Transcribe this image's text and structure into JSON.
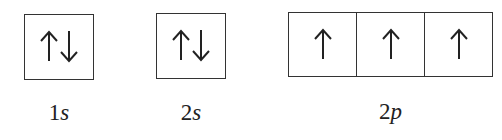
{
  "orbitals": [
    {
      "label_num": "1",
      "label_sub": "s",
      "boxes": [
        [
          "up",
          "down"
        ]
      ]
    },
    {
      "label_num": "2",
      "label_sub": "s",
      "boxes": [
        [
          "up",
          "down"
        ]
      ]
    },
    {
      "label_num": "2",
      "label_sub": "p",
      "boxes": [
        [
          "up"
        ],
        [
          "up"
        ],
        [
          "up"
        ]
      ]
    }
  ],
  "colors": {
    "line": "#333333",
    "background": "#ffffff"
  }
}
